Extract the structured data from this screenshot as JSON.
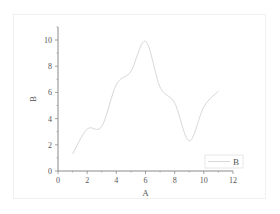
{
  "chart_data": {
    "type": "line",
    "title": "",
    "xlabel": "A",
    "ylabel": "B",
    "xlim": [
      0,
      12
    ],
    "ylim": [
      0,
      11
    ],
    "xticks": [
      0,
      2,
      4,
      6,
      8,
      10,
      12
    ],
    "yticks": [
      0,
      2,
      4,
      6,
      8,
      10
    ],
    "x_tick_labels": [
      "0",
      "2",
      "4",
      "6",
      "8",
      "10",
      "12"
    ],
    "y_tick_labels": [
      "0",
      "2",
      "4",
      "6",
      "8",
      "10"
    ],
    "grid": false,
    "legend_position": "lower right",
    "series": [
      {
        "name": "B",
        "color": "#d8d8d8",
        "x": [
          1,
          2,
          3,
          4,
          5,
          6,
          7,
          8,
          9,
          10,
          11
        ],
        "values": [
          1.3,
          3.2,
          3.4,
          6.6,
          7.6,
          9.9,
          6.4,
          5.2,
          2.3,
          4.9,
          6.1
        ]
      }
    ]
  },
  "legend": {
    "label": "B"
  },
  "axes": {
    "x_title": "A",
    "y_title": "B"
  }
}
